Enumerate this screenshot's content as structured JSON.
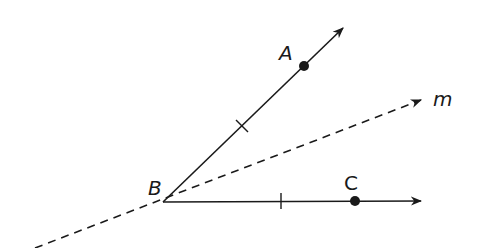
{
  "diagram": {
    "title": "",
    "colors": {
      "stroke": "#1a1a1a",
      "background": "#ffffff"
    },
    "points": [
      {
        "id": "A",
        "label": "A",
        "x": 304,
        "y": 66
      },
      {
        "id": "B",
        "label": "B",
        "x": 163,
        "y": 202
      },
      {
        "id": "C",
        "label": "C",
        "x": 355,
        "y": 201
      }
    ],
    "rays": [
      {
        "id": "ray-BA",
        "from": "B",
        "through": "A",
        "style": "solid",
        "end": [
          343,
          28
        ]
      },
      {
        "id": "ray-BC",
        "from": "B",
        "through": "C",
        "style": "solid",
        "end": [
          421,
          201
        ]
      }
    ],
    "lines": [
      {
        "id": "line-m",
        "label": "m",
        "style": "dashed",
        "start": [
          35,
          248
        ],
        "end": [
          421,
          100
        ]
      }
    ],
    "tick_marks": [
      {
        "on": "ray-BA",
        "x": 242,
        "y": 126
      },
      {
        "on": "ray-BC",
        "x": 281,
        "y": 201
      }
    ],
    "labels": {
      "A": "A",
      "B": "B",
      "C": "C",
      "m": "m"
    }
  }
}
